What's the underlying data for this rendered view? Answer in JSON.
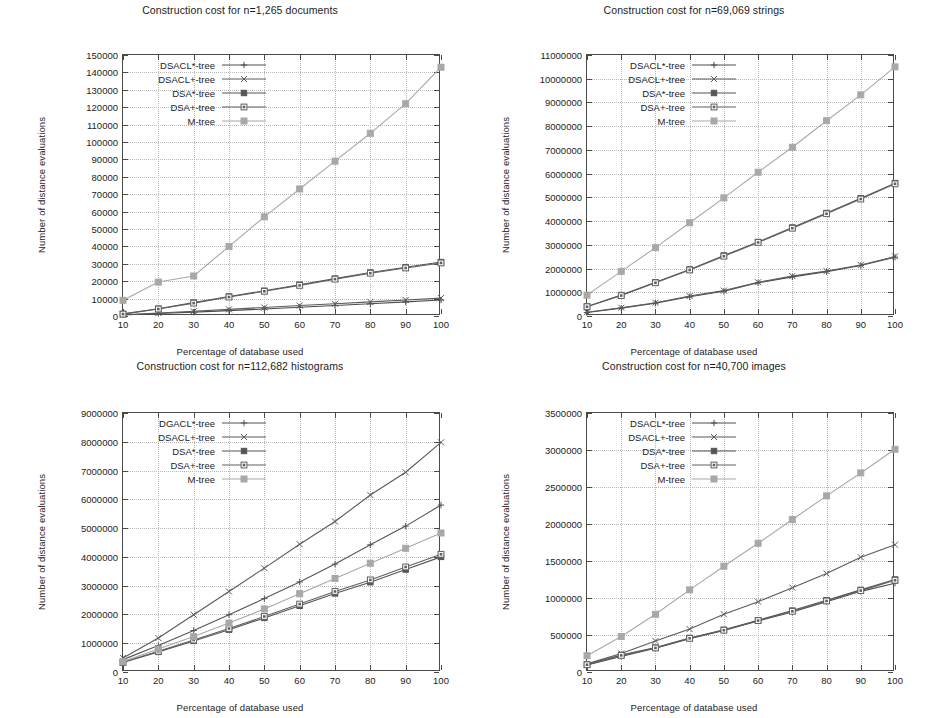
{
  "common": {
    "xlabel": "Percentage of database used",
    "ylabel": "Number of distance evaluations",
    "x": [
      10,
      20,
      30,
      40,
      50,
      60,
      70,
      80,
      90,
      100
    ],
    "colors": {
      "DSACL*-tree": "#4d4d4d",
      "DSACL+-tree": "#5a5a5a",
      "DSA*-tree": "#555555",
      "DSA+-tree": "#606060",
      "M-tree": "#a8a8a8",
      "axis": "#4a4a4a",
      "grid": "#b9b9b9",
      "text": "#1c1c1c",
      "background": "#ffffff"
    }
  },
  "charts": [
    {
      "id": "documents",
      "chart_data": {
        "type": "line",
        "title": "Construction cost for n=1,265 documents",
        "xlabel": "Percentage of database used",
        "ylabel": "Number of distance evaluations",
        "x": [
          10,
          20,
          30,
          40,
          50,
          60,
          70,
          80,
          90,
          100
        ],
        "xlim": [
          10,
          100
        ],
        "ylim": [
          0,
          150000
        ],
        "yticks": [
          0,
          10000,
          20000,
          30000,
          40000,
          50000,
          60000,
          70000,
          80000,
          90000,
          100000,
          110000,
          120000,
          130000,
          140000,
          150000
        ],
        "xticks": [
          10,
          20,
          30,
          40,
          50,
          60,
          70,
          80,
          90,
          100
        ],
        "grid": true,
        "legend_position": "top-left",
        "series": [
          {
            "name": "DSACL*-tree",
            "marker": "plus",
            "values": [
              600,
              1400,
              2200,
              3100,
              4000,
              5000,
              6000,
              7000,
              8100,
              9200
            ]
          },
          {
            "name": "DSACL+-tree",
            "marker": "cross",
            "values": [
              700,
              1700,
              2700,
              3800,
              4900,
              6000,
              7000,
              8100,
              9200,
              10300
            ]
          },
          {
            "name": "DSA*-tree",
            "marker": "fsquare",
            "values": [
              1200,
              4200,
              7700,
              11200,
              14500,
              18000,
              21500,
              25000,
              28000,
              31000
            ]
          },
          {
            "name": "DSA+-tree",
            "marker": "osquare",
            "values": [
              1100,
              4000,
              7400,
              10900,
              14200,
              17600,
              21200,
              24600,
              27600,
              30500
            ]
          },
          {
            "name": "M-tree",
            "marker": "gsquare",
            "values": [
              9000,
              19500,
              23000,
              40000,
              57000,
              73000,
              89000,
              105000,
              122000,
              143000
            ]
          }
        ]
      }
    },
    {
      "id": "strings",
      "chart_data": {
        "type": "line",
        "title": "Construction cost for n=69,069 strings",
        "xlabel": "Percentage of database used",
        "ylabel": "Number of distance evaluations",
        "x": [
          10,
          20,
          30,
          40,
          50,
          60,
          70,
          80,
          90,
          100
        ],
        "xlim": [
          10,
          100
        ],
        "ylim": [
          0,
          11000000
        ],
        "yticks": [
          0,
          1000000,
          2000000,
          3000000,
          4000000,
          5000000,
          6000000,
          7000000,
          8000000,
          9000000,
          10000000,
          11000000
        ],
        "xticks": [
          10,
          20,
          30,
          40,
          50,
          60,
          70,
          80,
          90,
          100
        ],
        "grid": true,
        "legend_position": "top-left",
        "series": [
          {
            "name": "DSACL*-tree",
            "marker": "plus",
            "values": [
              150000,
              330000,
              540000,
              810000,
              1040000,
              1400000,
              1650000,
              1870000,
              2130000,
              2480000
            ]
          },
          {
            "name": "DSACL+-tree",
            "marker": "cross",
            "values": [
              160000,
              350000,
              560000,
              840000,
              1070000,
              1420000,
              1680000,
              1890000,
              2150000,
              2510000
            ]
          },
          {
            "name": "DSA*-tree",
            "marker": "fsquare",
            "values": [
              400000,
              880000,
              1420000,
              1960000,
              2550000,
              3120000,
              3730000,
              4340000,
              4960000,
              5600000
            ]
          },
          {
            "name": "DSA+-tree",
            "marker": "osquare",
            "values": [
              390000,
              860000,
              1400000,
              1940000,
              2520000,
              3100000,
              3700000,
              4310000,
              4930000,
              5570000
            ]
          },
          {
            "name": "M-tree",
            "marker": "gsquare",
            "values": [
              880000,
              1880000,
              2880000,
              3930000,
              4980000,
              6060000,
              7110000,
              8230000,
              9320000,
              10500000
            ]
          }
        ]
      }
    },
    {
      "id": "histograms",
      "chart_data": {
        "type": "line",
        "title": "Construction cost for n=112,682 histograms",
        "xlabel": "Percentage of database used",
        "ylabel": "Number of distance evaluations",
        "x": [
          10,
          20,
          30,
          40,
          50,
          60,
          70,
          80,
          90,
          100
        ],
        "xlim": [
          10,
          100
        ],
        "ylim": [
          0,
          9000000
        ],
        "yticks": [
          0,
          1000000,
          2000000,
          3000000,
          4000000,
          5000000,
          6000000,
          7000000,
          8000000,
          9000000
        ],
        "xticks": [
          10,
          20,
          30,
          40,
          50,
          60,
          70,
          80,
          90,
          100
        ],
        "grid": true,
        "legend_position": "top-left",
        "series": [
          {
            "name": "DGACL*-tree",
            "marker": "plus",
            "values": [
              430000,
              920000,
              1440000,
              1990000,
              2550000,
              3130000,
              3750000,
              4420000,
              5070000,
              5800000
            ]
          },
          {
            "name": "DSACL+-tree",
            "marker": "cross",
            "values": [
              490000,
              1180000,
              1990000,
              2800000,
              3610000,
              4440000,
              5230000,
              6150000,
              6940000,
              7980000
            ]
          },
          {
            "name": "DSA*-tree",
            "marker": "fsquare",
            "values": [
              330000,
              700000,
              1080000,
              1470000,
              1880000,
              2300000,
              2730000,
              3120000,
              3560000,
              4000000
            ]
          },
          {
            "name": "DSA+-tree",
            "marker": "osquare",
            "values": [
              340000,
              720000,
              1110000,
              1510000,
              1930000,
              2360000,
              2800000,
              3200000,
              3650000,
              4090000
            ]
          },
          {
            "name": "M-tree",
            "marker": "gsquare",
            "values": [
              360000,
              800000,
              1230000,
              1700000,
              2190000,
              2720000,
              3250000,
              3780000,
              4300000,
              4830000
            ]
          }
        ]
      }
    },
    {
      "id": "images",
      "chart_data": {
        "type": "line",
        "title": "Construction cost for n=40,700 images",
        "xlabel": "Percentage of database used",
        "ylabel": "Number of distance evaluations",
        "x": [
          10,
          20,
          30,
          40,
          50,
          60,
          70,
          80,
          90,
          100
        ],
        "xlim": [
          10,
          100
        ],
        "ylim": [
          0,
          3500000
        ],
        "yticks": [
          0,
          500000,
          1000000,
          1500000,
          2000000,
          2500000,
          3000000,
          3500000
        ],
        "xticks": [
          10,
          20,
          30,
          40,
          50,
          60,
          70,
          80,
          90,
          100
        ],
        "grid": true,
        "legend_position": "top-left",
        "series": [
          {
            "name": "DSACL*-tree",
            "marker": "plus",
            "values": [
              95000,
              210000,
              320000,
              450000,
              560000,
              690000,
              810000,
              950000,
              1090000,
              1200000
            ]
          },
          {
            "name": "DSACL+-tree",
            "marker": "cross",
            "values": [
              110000,
              250000,
              420000,
              580000,
              780000,
              950000,
              1140000,
              1330000,
              1550000,
              1720000
            ]
          },
          {
            "name": "DSA*-tree",
            "marker": "fsquare",
            "values": [
              100000,
              230000,
              330000,
              460000,
              570000,
              700000,
              830000,
              970000,
              1110000,
              1250000
            ]
          },
          {
            "name": "DSA+-tree",
            "marker": "osquare",
            "values": [
              98000,
              225000,
              325000,
              455000,
              565000,
              695000,
              820000,
              960000,
              1100000,
              1240000
            ]
          },
          {
            "name": "M-tree",
            "marker": "gsquare",
            "values": [
              220000,
              480000,
              780000,
              1110000,
              1430000,
              1740000,
              2060000,
              2380000,
              2690000,
              3010000
            ]
          }
        ]
      }
    }
  ]
}
